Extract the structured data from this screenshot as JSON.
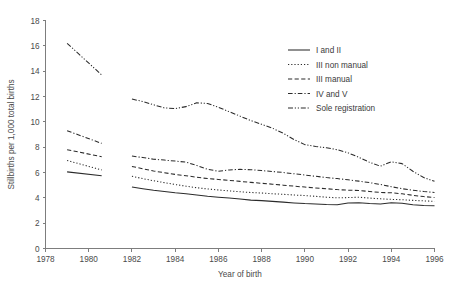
{
  "chart_data": {
    "type": "line",
    "title": "",
    "xlabel": "Year of birth",
    "ylabel": "Stillbirths per 1,000 total births",
    "xlim": [
      1978,
      1996
    ],
    "ylim": [
      0,
      18
    ],
    "xticks": [
      1978,
      1980,
      1982,
      1984,
      1986,
      1988,
      1990,
      1992,
      1994,
      1996
    ],
    "xticklabels": [
      "1978",
      "1980",
      "1982",
      "1984",
      "1986",
      "1988",
      "1990",
      "1992",
      "1994",
      "1996"
    ],
    "yticks": [
      0,
      2,
      4,
      6,
      8,
      10,
      12,
      14,
      16,
      18
    ],
    "yticklabels": [
      "0",
      "2",
      "4",
      "6",
      "8",
      "10",
      "12",
      "14",
      "16",
      "18"
    ],
    "grid": false,
    "legend_position": "upper-right",
    "series": [
      {
        "name": "I and II",
        "style": "solid",
        "dasharray": "none",
        "segments": [
          {
            "x": [
              1979.0,
              1980.6
            ],
            "y": [
              6.05,
              5.75
            ]
          },
          {
            "x": [
              1982.0,
              1982.5,
              1983.0,
              1983.5,
              1984.0,
              1984.5,
              1985.0,
              1985.5,
              1986.0,
              1986.5,
              1987.0,
              1987.5,
              1988.0,
              1988.5,
              1989.0,
              1989.5,
              1990.0,
              1990.5,
              1991.0,
              1991.5,
              1992.0,
              1992.5,
              1993.0,
              1993.5,
              1994.0,
              1994.5,
              1995.0,
              1995.5,
              1996.0
            ],
            "y": [
              4.85,
              4.72,
              4.6,
              4.5,
              4.4,
              4.32,
              4.22,
              4.12,
              4.05,
              3.98,
              3.9,
              3.82,
              3.78,
              3.72,
              3.66,
              3.6,
              3.55,
              3.52,
              3.48,
              3.46,
              3.6,
              3.62,
              3.55,
              3.52,
              3.62,
              3.58,
              3.45,
              3.4,
              3.38
            ]
          }
        ]
      },
      {
        "name": "III non manual",
        "style": "dotted",
        "dasharray": "1.2 2.0",
        "segments": [
          {
            "x": [
              1979.0,
              1980.6
            ],
            "y": [
              6.95,
              6.2
            ]
          },
          {
            "x": [
              1982.0,
              1982.5,
              1983.0,
              1983.5,
              1984.0,
              1984.5,
              1985.0,
              1985.5,
              1986.0,
              1986.5,
              1987.0,
              1987.5,
              1988.0,
              1988.5,
              1989.0,
              1989.5,
              1990.0,
              1990.5,
              1991.0,
              1991.5,
              1992.0,
              1992.5,
              1993.0,
              1993.5,
              1994.0,
              1994.5,
              1995.0,
              1995.5,
              1996.0
            ],
            "y": [
              5.7,
              5.52,
              5.35,
              5.2,
              5.05,
              4.92,
              4.8,
              4.7,
              4.62,
              4.55,
              4.48,
              4.42,
              4.38,
              4.32,
              4.28,
              4.22,
              4.18,
              4.12,
              4.05,
              4.0,
              4.02,
              4.05,
              3.98,
              3.92,
              3.88,
              3.85,
              3.8,
              3.76,
              3.72
            ]
          }
        ]
      },
      {
        "name": "III manual",
        "style": "dashed",
        "dasharray": "4.2 2.4",
        "segments": [
          {
            "x": [
              1979.0,
              1980.6
            ],
            "y": [
              7.8,
              7.25
            ]
          },
          {
            "x": [
              1982.0,
              1982.5,
              1983.0,
              1983.5,
              1984.0,
              1984.5,
              1985.0,
              1985.5,
              1986.0,
              1986.5,
              1987.0,
              1987.5,
              1988.0,
              1988.5,
              1989.0,
              1989.5,
              1990.0,
              1990.5,
              1991.0,
              1991.5,
              1992.0,
              1992.5,
              1993.0,
              1993.5,
              1994.0,
              1994.5,
              1995.0,
              1995.5,
              1996.0
            ],
            "y": [
              6.48,
              6.3,
              6.12,
              5.98,
              5.85,
              5.75,
              5.62,
              5.52,
              5.45,
              5.38,
              5.3,
              5.22,
              5.15,
              5.08,
              5.0,
              4.92,
              4.85,
              4.78,
              4.72,
              4.65,
              4.6,
              4.58,
              4.5,
              4.42,
              4.4,
              4.32,
              4.2,
              4.1,
              4.02
            ]
          }
        ]
      },
      {
        "name": "IV and V",
        "style": "dashdot",
        "dasharray": "4.6 2.0 1.2 2.0",
        "segments": [
          {
            "x": [
              1979.0,
              1980.6
            ],
            "y": [
              9.3,
              8.3
            ]
          },
          {
            "x": [
              1982.0,
              1982.5,
              1983.0,
              1983.5,
              1984.0,
              1984.5,
              1985.0,
              1985.5,
              1986.0,
              1986.5,
              1987.0,
              1987.5,
              1988.0,
              1988.5,
              1989.0,
              1989.5,
              1990.0,
              1990.5,
              1991.0,
              1991.5,
              1992.0,
              1992.5,
              1993.0,
              1993.5,
              1994.0,
              1994.5,
              1995.0,
              1995.5,
              1996.0
            ],
            "y": [
              7.3,
              7.18,
              7.05,
              6.98,
              6.9,
              6.82,
              6.55,
              6.25,
              6.1,
              6.2,
              6.25,
              6.22,
              6.15,
              6.08,
              6.0,
              5.9,
              5.8,
              5.7,
              5.6,
              5.52,
              5.42,
              5.32,
              5.2,
              5.05,
              4.88,
              4.72,
              4.6,
              4.5,
              4.42
            ]
          }
        ]
      },
      {
        "name": "Sole registration",
        "style": "dashdotdot",
        "dasharray": "5.0 1.8 1.2 1.8 1.2 1.8",
        "segments": [
          {
            "x": [
              1979.0,
              1980.6
            ],
            "y": [
              16.2,
              13.7
            ]
          },
          {
            "x": [
              1982.0,
              1982.5,
              1983.0,
              1983.5,
              1984.0,
              1984.5,
              1985.0,
              1985.5,
              1986.0,
              1986.5,
              1987.0,
              1987.5,
              1988.0,
              1988.5,
              1989.0,
              1989.5,
              1990.0,
              1990.5,
              1991.0,
              1991.5,
              1992.0,
              1992.5,
              1993.0,
              1993.5,
              1994.0,
              1994.5,
              1995.0,
              1995.5,
              1996.0
            ],
            "y": [
              11.8,
              11.6,
              11.35,
              11.1,
              11.05,
              11.2,
              11.5,
              11.45,
              11.15,
              10.8,
              10.45,
              10.1,
              9.8,
              9.5,
              9.1,
              8.6,
              8.2,
              8.05,
              7.95,
              7.8,
              7.55,
              7.2,
              6.8,
              6.5,
              6.85,
              6.7,
              6.1,
              5.6,
              5.3
            ]
          }
        ]
      }
    ],
    "legend": [
      {
        "label": "I and II",
        "dasharray": "none"
      },
      {
        "label": "III non manual",
        "dasharray": "1.2 2.0"
      },
      {
        "label": "III manual",
        "dasharray": "4.2 2.4"
      },
      {
        "label": "IV and V",
        "dasharray": "4.6 2.0 1.2 2.0"
      },
      {
        "label": "Sole registration",
        "dasharray": "5.0 1.8 1.2 1.8 1.2 1.8"
      }
    ]
  }
}
